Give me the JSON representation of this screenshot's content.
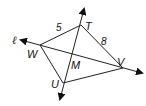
{
  "diagram": {
    "type": "geometry",
    "points": {
      "T": {
        "label": "T",
        "x": 81,
        "y": 25
      },
      "W": {
        "label": "W",
        "x": 40,
        "y": 45
      },
      "V": {
        "label": "V",
        "x": 123,
        "y": 68
      },
      "U": {
        "label": "U",
        "x": 63,
        "y": 83
      },
      "M": {
        "label": "M",
        "x": 73,
        "y": 55
      }
    },
    "segments": [
      {
        "from": "W",
        "to": "T",
        "length_label": "5"
      },
      {
        "from": "T",
        "to": "V",
        "length_label": "8"
      },
      {
        "from": "W",
        "to": "U"
      },
      {
        "from": "U",
        "to": "V"
      }
    ],
    "lines": [
      {
        "name": "line-TU",
        "through": [
          "T",
          "U"
        ]
      },
      {
        "name": "line-ell",
        "label": "ℓ",
        "through": [
          "W",
          "V"
        ]
      }
    ],
    "labels": {
      "T": "T",
      "W": "W",
      "V": "V",
      "U": "U",
      "M": "M",
      "ell": "ℓ",
      "len_WT": "5",
      "len_TV": "8"
    }
  }
}
